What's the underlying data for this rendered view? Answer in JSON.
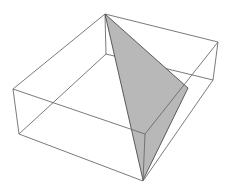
{
  "figure": {
    "type": "3d-box-with-triangle",
    "width": 229,
    "height": 194,
    "background": "#ffffff",
    "edge_color": "#6b6b6b",
    "triangle_fill": "#b8b8b8",
    "triangle_stroke": "#3a3a3a",
    "box_vertices": {
      "top_back": [
        105,
        14
      ],
      "top_right": [
        218,
        42
      ],
      "top_front": [
        145,
        134
      ],
      "top_left": [
        13,
        89
      ],
      "bottom_back": [
        106,
        54
      ],
      "bottom_right": [
        213,
        80
      ],
      "bottom_front": [
        143,
        181
      ],
      "bottom_left": [
        19,
        134
      ]
    },
    "triangle_vertices": [
      [
        105,
        14
      ],
      [
        188,
        88
      ],
      [
        143,
        180
      ]
    ]
  }
}
